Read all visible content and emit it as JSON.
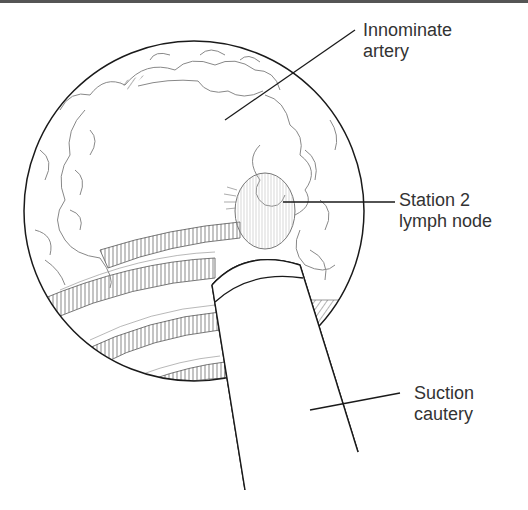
{
  "figure": {
    "colors": {
      "line": "#1a1a1a",
      "tissue_line": "#888888",
      "text": "#333333",
      "background": "#ffffff",
      "top_border": "#555555"
    }
  },
  "labels": [
    {
      "id": "innominate-artery",
      "line1": "Innominate",
      "line2": "artery"
    },
    {
      "id": "station-2-lymph-node",
      "line1": "Station 2",
      "line2": "lymph node"
    },
    {
      "id": "suction-cautery",
      "line1": "Suction",
      "line2": "cautery"
    }
  ]
}
